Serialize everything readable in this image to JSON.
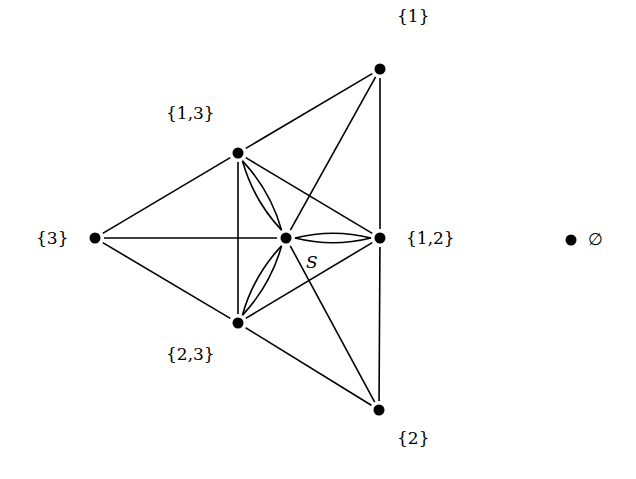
{
  "diagram": {
    "type": "graph",
    "nodes": [
      {
        "id": "n1",
        "label": "{1}",
        "x": 380,
        "y": 69,
        "lx": 397,
        "ly": 8
      },
      {
        "id": "n13",
        "label": "{1,3}",
        "x": 238,
        "y": 153,
        "lx": 166,
        "ly": 105
      },
      {
        "id": "n3",
        "label": "{3}",
        "x": 95,
        "y": 238,
        "lx": 36,
        "ly": 230
      },
      {
        "id": "S",
        "label": "S",
        "x": 286,
        "y": 238,
        "lx": 306,
        "ly": 254,
        "italic": true
      },
      {
        "id": "n12",
        "label": "{1,2}",
        "x": 380,
        "y": 238,
        "lx": 406,
        "ly": 230
      },
      {
        "id": "n23",
        "label": "{2,3}",
        "x": 238,
        "y": 323,
        "lx": 166,
        "ly": 346
      },
      {
        "id": "n2",
        "label": "{2}",
        "x": 379,
        "y": 410,
        "lx": 397,
        "ly": 430
      },
      {
        "id": "empty",
        "label": "∅",
        "x": 571,
        "y": 240,
        "lx": 588,
        "ly": 231
      }
    ],
    "edges": [
      {
        "from": "n1",
        "to": "n13"
      },
      {
        "from": "n1",
        "to": "n12"
      },
      {
        "from": "n1",
        "to": "S"
      },
      {
        "from": "n13",
        "to": "n3"
      },
      {
        "from": "n13",
        "to": "n23"
      },
      {
        "from": "n13",
        "to": "n12"
      },
      {
        "from": "n3",
        "to": "S"
      },
      {
        "from": "n3",
        "to": "n23"
      },
      {
        "from": "n23",
        "to": "n2"
      },
      {
        "from": "n23",
        "to": "n12"
      },
      {
        "from": "n12",
        "to": "n2"
      },
      {
        "from": "S",
        "to": "n2"
      }
    ],
    "double_edges": [
      {
        "from": "S",
        "to": "n13"
      },
      {
        "from": "S",
        "to": "n12"
      },
      {
        "from": "S",
        "to": "n23"
      }
    ],
    "colors": {
      "line": "#000000",
      "node": "#000000",
      "background": "#ffffff"
    }
  }
}
